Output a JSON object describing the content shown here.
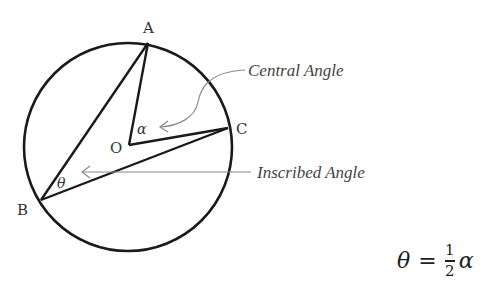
{
  "diagram": {
    "colors": {
      "stroke": "#1a1a1a",
      "leader": "#8a8a8a",
      "text": "#333333"
    },
    "points": {
      "A": {
        "label": "A",
        "x": 148,
        "y": 43
      },
      "B": {
        "label": "B",
        "x": 41,
        "y": 200
      },
      "C": {
        "label": "C",
        "x": 228,
        "y": 128
      },
      "O": {
        "label": "O",
        "x": 129,
        "y": 145
      }
    },
    "circle": {
      "cx": 128,
      "cy": 147,
      "r": 104
    },
    "angles": {
      "central": {
        "symbol": "α",
        "vertex": "O"
      },
      "inscribed": {
        "symbol": "θ",
        "vertex": "B"
      }
    },
    "callouts": {
      "central": "Central Angle",
      "inscribed": "Inscribed Angle"
    },
    "formula": {
      "lhs": "θ",
      "equals": "=",
      "numerator": "1",
      "denominator": "2",
      "rhs": "α"
    }
  }
}
